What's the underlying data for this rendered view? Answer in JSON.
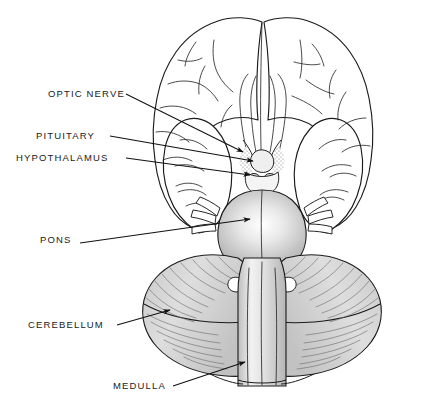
{
  "figure": {
    "background_color": "#ffffff",
    "line_color": "#1b1b1b",
    "shading_color": "#d8d8d8",
    "width": 423,
    "height": 418
  },
  "labels": [
    {
      "id": "optic-nerve",
      "text": "OPTIC NERVE",
      "x": 48,
      "y": 97,
      "leader_to_x": 243,
      "leader_to_y": 152
    },
    {
      "id": "pituitary",
      "text": "PITUITARY",
      "x": 36,
      "y": 139,
      "leader_to_x": 253,
      "leader_to_y": 161
    },
    {
      "id": "hypothalamus",
      "text": "HYPOTHALAMUS",
      "x": 16,
      "y": 161,
      "leader_to_x": 250,
      "leader_to_y": 175
    },
    {
      "id": "pons",
      "text": "PONS",
      "x": 40,
      "y": 243,
      "leader_to_x": 250,
      "leader_to_y": 219
    },
    {
      "id": "cerebellum",
      "text": "CEREBELLUM",
      "x": 28,
      "y": 328,
      "leader_to_x": 170,
      "leader_to_y": 310
    },
    {
      "id": "medulla",
      "text": "MEDULLA",
      "x": 113,
      "y": 389,
      "leader_to_x": 245,
      "leader_to_y": 362
    }
  ],
  "structures": [
    {
      "id": "frontal-lobe-left",
      "name": "left frontal lobe"
    },
    {
      "id": "frontal-lobe-right",
      "name": "right frontal lobe"
    },
    {
      "id": "temporal-lobe-left",
      "name": "left temporal lobe"
    },
    {
      "id": "temporal-lobe-right",
      "name": "right temporal lobe"
    },
    {
      "id": "olfactory-tract-left",
      "name": "left olfactory tract"
    },
    {
      "id": "olfactory-tract-right",
      "name": "right olfactory tract"
    },
    {
      "id": "optic-chiasm",
      "name": "optic chiasm"
    },
    {
      "id": "pituitary-stalk",
      "name": "pituitary / infundibulum"
    },
    {
      "id": "mammillary-bodies",
      "name": "mammillary bodies"
    },
    {
      "id": "pons-body",
      "name": "pons"
    },
    {
      "id": "cerebellum-left",
      "name": "left cerebellar hemisphere"
    },
    {
      "id": "cerebellum-right",
      "name": "right cerebellar hemisphere"
    },
    {
      "id": "medulla-body",
      "name": "medulla oblongata"
    },
    {
      "id": "cranial-nerves",
      "name": "cranial nerve roots"
    }
  ]
}
